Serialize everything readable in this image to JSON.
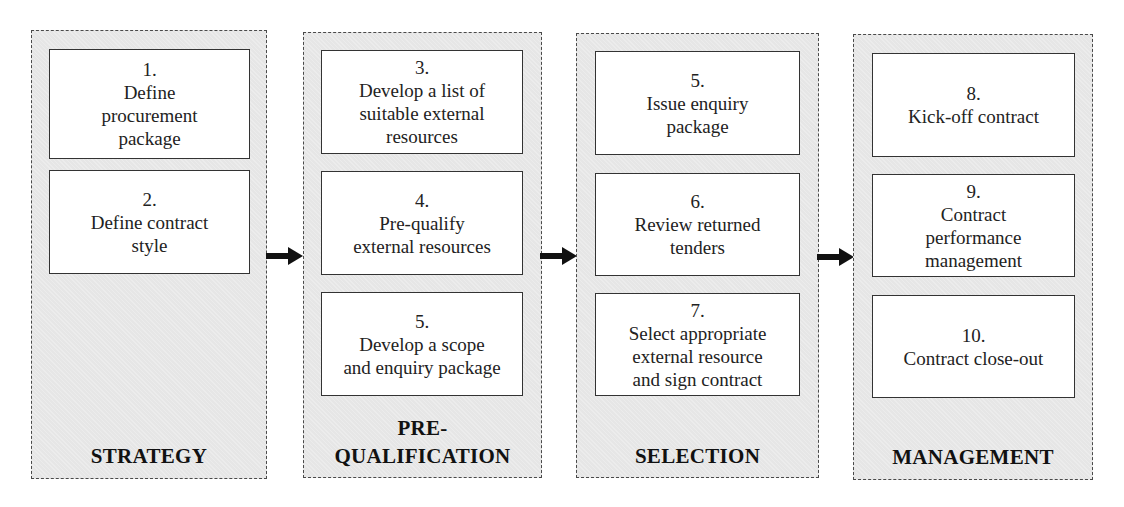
{
  "diagram": {
    "stages": [
      {
        "label": "STRATEGY",
        "steps": [
          {
            "number": "1.",
            "text": "Define\nprocurement\npackage"
          },
          {
            "number": "2.",
            "text": "Define contract\nstyle"
          }
        ]
      },
      {
        "label": "PRE-\nQUALIFICATION",
        "steps": [
          {
            "number": "3.",
            "text": "Develop a list of\nsuitable external\nresources"
          },
          {
            "number": "4.",
            "text": "Pre-qualify\nexternal resources"
          },
          {
            "number": "5.",
            "text": "Develop a scope\nand enquiry package"
          }
        ]
      },
      {
        "label": "SELECTION",
        "steps": [
          {
            "number": "5.",
            "text": "Issue enquiry\npackage"
          },
          {
            "number": "6.",
            "text": "Review returned\ntenders"
          },
          {
            "number": "7.",
            "text": "Select appropriate\nexternal resource\nand sign contract"
          }
        ]
      },
      {
        "label": "MANAGEMENT",
        "steps": [
          {
            "number": "8.",
            "text": "Kick-off contract"
          },
          {
            "number": "9.",
            "text": "Contract\nperformance\nmanagement"
          },
          {
            "number": "10.",
            "text": "Contract close-out"
          }
        ]
      }
    ],
    "arrows": [
      {
        "from": "STRATEGY",
        "to": "PRE-QUALIFICATION",
        "icon": "right-arrow-icon"
      },
      {
        "from": "PRE-QUALIFICATION",
        "to": "SELECTION",
        "icon": "right-arrow-icon"
      },
      {
        "from": "SELECTION",
        "to": "MANAGEMENT",
        "icon": "right-arrow-icon"
      }
    ],
    "colors": {
      "stage_fill": "#e6e6e6",
      "stage_border": "#4a4a4a",
      "step_fill": "#ffffff",
      "step_border": "#333333",
      "arrow": "#111111"
    }
  }
}
